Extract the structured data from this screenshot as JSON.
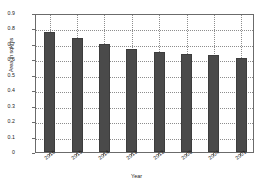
{
  "chart_data": {
    "type": "bar",
    "title": "",
    "xlabel": "Year",
    "ylabel": "Area in sqkms",
    "categories": [
      "2016",
      "2015",
      "2014",
      "2013",
      "2012",
      "2008",
      "2004",
      "2001"
    ],
    "values": [
      0.78,
      0.74,
      0.7,
      0.665,
      0.648,
      0.633,
      0.628,
      0.608
    ],
    "ylim": [
      0,
      0.9
    ],
    "yticks": [
      "0",
      "0.1",
      "0.2",
      "0.3",
      "0.4",
      "0.5",
      "0.6",
      "0.7",
      "0.8",
      "0.9"
    ],
    "ytick_values": [
      0,
      0.1,
      0.2,
      0.3,
      0.4,
      0.5,
      0.6,
      0.7,
      0.8,
      0.9
    ],
    "grid": true,
    "legend": false,
    "bar_color": "#4a4a4a",
    "bar_edge_color": "#3d3d3d",
    "grid_color": "#8d8d8d",
    "axes_color": "#6b6b6b",
    "background": "#ffffff"
  }
}
